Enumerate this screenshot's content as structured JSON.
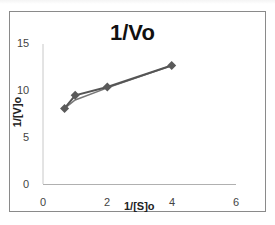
{
  "chart_data": {
    "type": "line",
    "title": "1/Vo",
    "xlabel": "1/[S]o",
    "ylabel": "1/[V]o",
    "xlim": [
      0,
      6
    ],
    "ylim": [
      0,
      15
    ],
    "x_ticks": [
      "0",
      "2",
      "4",
      "6"
    ],
    "y_ticks": [
      "0",
      "5",
      "10",
      "15"
    ],
    "grid": false,
    "legend": null,
    "series": [
      {
        "name": "1/Vo",
        "x": [
          0.67,
          1.0,
          2.0,
          4.0
        ],
        "y": [
          8.1,
          9.5,
          10.4,
          12.7
        ],
        "marker": "diamond",
        "color": "#555555"
      },
      {
        "name": "fit",
        "x": [
          0.67,
          1.0,
          2.0,
          4.0
        ],
        "y": [
          8.1,
          9.0,
          10.3,
          12.7
        ],
        "marker": "none",
        "color": "#777777"
      }
    ]
  },
  "labels": {
    "title": "1/Vo",
    "xlabel": "1/[S]o",
    "ylabel": "1/[V]o",
    "y15": "15",
    "y10": "10",
    "y5": "5",
    "y0": "0",
    "x0": "0",
    "x2": "2",
    "x4": "4",
    "x6": "6"
  }
}
